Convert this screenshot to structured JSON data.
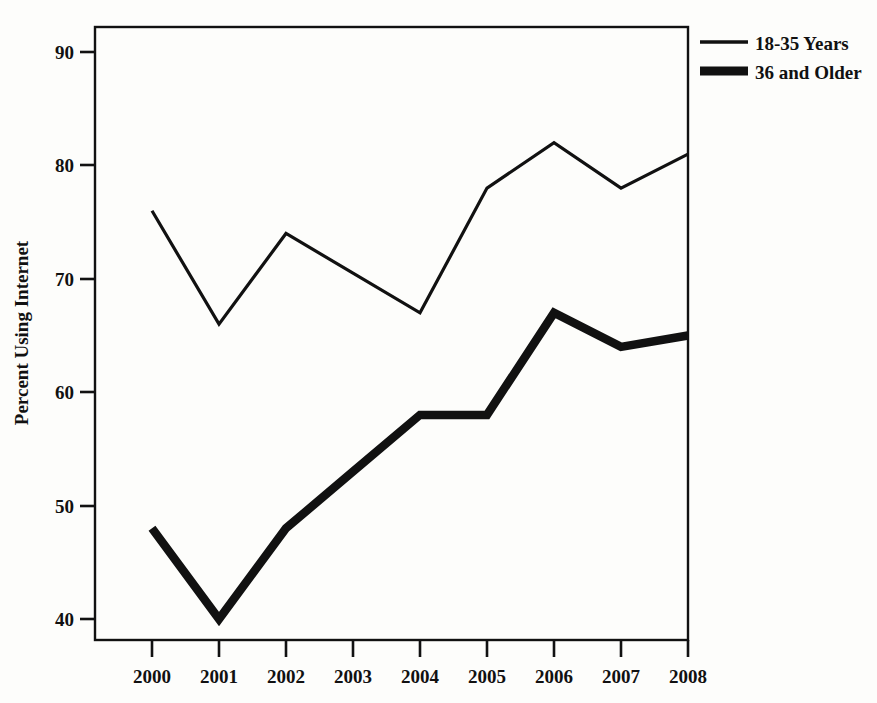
{
  "chart_data": {
    "type": "line",
    "title": "",
    "xlabel": "",
    "ylabel": "Percent Using Internet",
    "categories": [
      "2000",
      "2001",
      "2002",
      "2003",
      "2004",
      "2005",
      "2006",
      "2007",
      "2008"
    ],
    "x": [
      2000,
      2001,
      2002,
      2003,
      2004,
      2005,
      2006,
      2007,
      2008
    ],
    "series": [
      {
        "name": "18-35 Years",
        "values": [
          76,
          66,
          74,
          70.5,
          67,
          78,
          82,
          78,
          81
        ],
        "line_style": "thin",
        "color": "#111111"
      },
      {
        "name": "36 and Older",
        "values": [
          48,
          40,
          48,
          53,
          58,
          58,
          67,
          64,
          65
        ],
        "line_style": "thick",
        "color": "#111111"
      }
    ],
    "ylim": [
      37,
      93
    ],
    "yticks": [
      40,
      50,
      60,
      70,
      80,
      90
    ],
    "ytick_labels": [
      "40",
      "50",
      "60",
      "70",
      "80",
      "90"
    ],
    "xtick_labels": [
      "2000",
      "2001",
      "2002",
      "2003",
      "2004",
      "2005",
      "2006",
      "2007",
      "2008"
    ],
    "grid": false,
    "legend_position": "top-right-outside",
    "legend": [
      {
        "label": "18-35 Years",
        "style": "thin"
      },
      {
        "label": "36 and Older",
        "style": "thick"
      }
    ]
  },
  "axes": {
    "y_title": "Percent Using Internet",
    "y_ticks": [
      "90",
      "80",
      "70",
      "60",
      "50",
      "40"
    ],
    "x_ticks": [
      "2000",
      "2001",
      "2002",
      "2003",
      "2004",
      "2005",
      "2006",
      "2007",
      "2008"
    ]
  },
  "legend": {
    "entry_1_label": "18-35 Years",
    "entry_2_label": "36 and Older"
  },
  "colors": {
    "ink": "#111111",
    "paper": "#fdfdfb"
  }
}
